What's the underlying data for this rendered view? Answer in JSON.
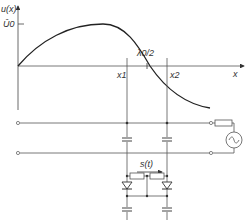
{
  "graph": {
    "y_axis_label": "u(x)",
    "peak_label": "Û0",
    "x_axis_label": "x",
    "wavelength_label": "λ0/2",
    "x1_label": "x1",
    "x2_label": "x2"
  },
  "circuit": {
    "displacement_label": "s(t)",
    "source_symbol": "~"
  },
  "colors": {
    "line": "#333333",
    "axis": "#555555",
    "background": "#ffffff"
  }
}
